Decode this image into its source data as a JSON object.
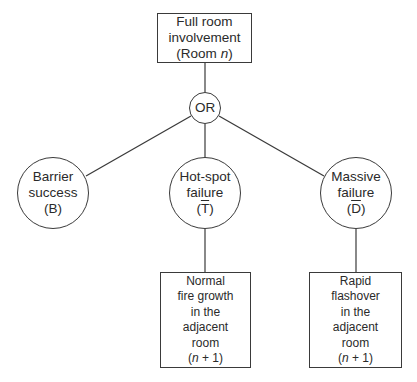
{
  "diagram": {
    "type": "event tree",
    "root": {
      "lines": [
        "Full room",
        "involvement"
      ],
      "paren_prefix": "(Room ",
      "paren_var": "n",
      "paren_suffix": ")"
    },
    "gate": {
      "label": "OR"
    },
    "branches": [
      {
        "id": "barrier",
        "lines": [
          "Barrier",
          "success"
        ],
        "symbol": "B",
        "symbol_overbar": false
      },
      {
        "id": "hotspot",
        "lines": [
          "Hot-spot",
          "failure"
        ],
        "symbol": "T",
        "symbol_overbar": true
      },
      {
        "id": "massive",
        "lines": [
          "Massive",
          "failure"
        ],
        "symbol": "D",
        "symbol_overbar": true
      }
    ],
    "outcomes": [
      {
        "parent": "hotspot",
        "lines": [
          "Normal",
          "fire growth",
          "in the",
          "adjacent",
          "room"
        ],
        "paren_var": "n",
        "paren_op": " + 1"
      },
      {
        "parent": "massive",
        "lines": [
          "Rapid",
          "flashover",
          "in the",
          "adjacent",
          "room"
        ],
        "paren_var": "n",
        "paren_op": " + 1"
      }
    ],
    "colors": {
      "stroke": "#3a3a3a",
      "text": "#2a2a2a",
      "background": "#ffffff"
    }
  }
}
